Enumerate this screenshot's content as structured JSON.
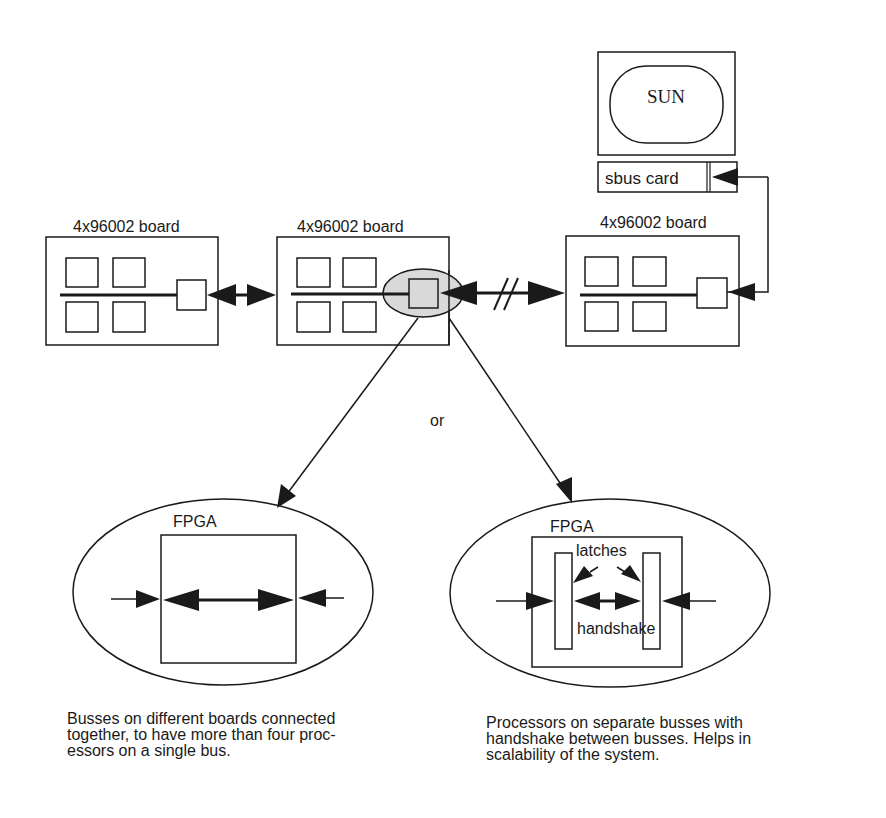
{
  "diagram": {
    "host": {
      "monitor_label": "SUN",
      "card_label": "sbus card"
    },
    "boards": [
      {
        "label": "4x96002 board"
      },
      {
        "label": "4x96002 board"
      },
      {
        "label": "4x96002 board"
      }
    ],
    "branch_label": "or",
    "options": [
      {
        "fpga_label": "FPGA",
        "caption_lines": [
          "Busses on different boards connected",
          "together, to have more than four proc-",
          "essors on a single bus."
        ]
      },
      {
        "fpga_label": "FPGA",
        "latches_label": "latches",
        "handshake_label": "handshake",
        "caption_lines": [
          "Processors on separate busses with",
          "handshake between busses. Helps in",
          "scalability of the system."
        ]
      }
    ],
    "colors": {
      "stroke": "#1a1a1a",
      "highlight_fill": "#d9d9d9",
      "background": "#ffffff"
    }
  }
}
